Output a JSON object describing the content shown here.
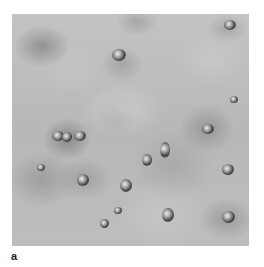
{
  "figure": {
    "panel_label": "a",
    "image": {
      "description": "Grayscale clinical photograph of skin surface with multiple small papular lesions surrounded by darker halos",
      "colors": {
        "background": "#bcbcbc",
        "lesion_dark": "#3e3e3e",
        "lesion_highlight": "#f0f0f0",
        "page": "#ffffff",
        "label": "#1a1a1a"
      }
    }
  }
}
